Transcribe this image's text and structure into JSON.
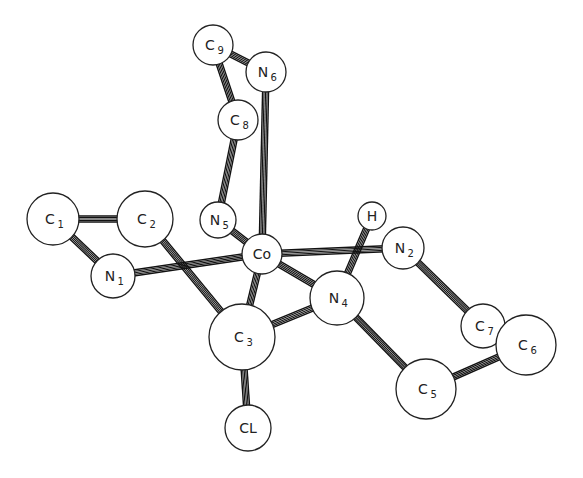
{
  "atoms": [
    {
      "id": "C9",
      "el": "C",
      "sub": "9"
    },
    {
      "id": "N6",
      "el": "N",
      "sub": "6"
    },
    {
      "id": "C8",
      "el": "C",
      "sub": "8"
    },
    {
      "id": "C1",
      "el": "C",
      "sub": "1"
    },
    {
      "id": "C2",
      "el": "C",
      "sub": "2"
    },
    {
      "id": "N5",
      "el": "N",
      "sub": "5"
    },
    {
      "id": "H",
      "el": "H",
      "sub": ""
    },
    {
      "id": "N2",
      "el": "N",
      "sub": "2"
    },
    {
      "id": "N1",
      "el": "N",
      "sub": "1"
    },
    {
      "id": "Co",
      "el": "Co",
      "sub": ""
    },
    {
      "id": "N4",
      "el": "N",
      "sub": "4"
    },
    {
      "id": "C3",
      "el": "C",
      "sub": "3"
    },
    {
      "id": "C7",
      "el": "C",
      "sub": "7"
    },
    {
      "id": "C6",
      "el": "C",
      "sub": "6"
    },
    {
      "id": "C5",
      "el": "C",
      "sub": "5"
    },
    {
      "id": "CL",
      "el": "CL",
      "sub": ""
    }
  ],
  "bonds": [
    [
      "C9",
      "C8"
    ],
    [
      "C9",
      "N6"
    ],
    [
      "C8",
      "N5"
    ],
    [
      "N6",
      "Co"
    ],
    [
      "C1",
      "C2"
    ],
    [
      "C1",
      "N1"
    ],
    [
      "N1",
      "Co"
    ],
    [
      "C2",
      "C3"
    ],
    [
      "N5",
      "Co"
    ],
    [
      "Co",
      "N2"
    ],
    [
      "Co",
      "N4"
    ],
    [
      "Co",
      "C3"
    ],
    [
      "H",
      "N4"
    ],
    [
      "N4",
      "C3"
    ],
    [
      "N4",
      "C5"
    ],
    [
      "N2",
      "C7"
    ],
    [
      "C7",
      "C6"
    ],
    [
      "C6",
      "C5"
    ],
    [
      "C3",
      "CL"
    ]
  ]
}
